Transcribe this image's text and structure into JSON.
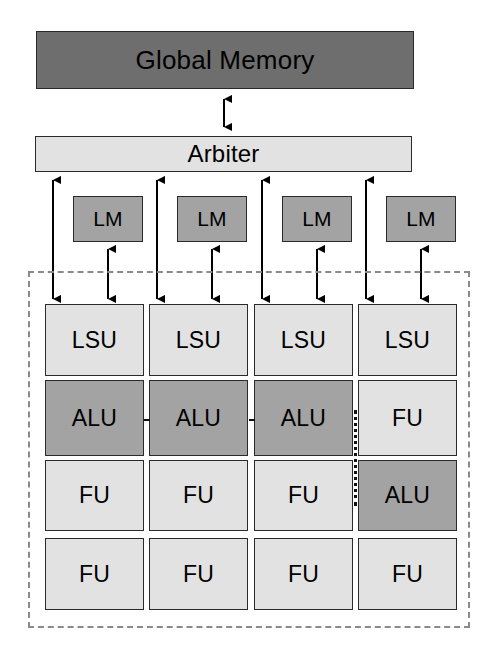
{
  "diagram": {
    "colors": {
      "dark_gray": "#6e6e6e",
      "mid_gray": "#a3a3a3",
      "light_gray": "#e2e2e2",
      "outline": "#2a2a2a",
      "dashed_border": "#8a8a8a",
      "arrow": "#000000",
      "background": "#ffffff"
    },
    "global_memory": {
      "label": "Global Memory",
      "shade": "dark"
    },
    "arbiter": {
      "label": "Arbiter",
      "shade": "light"
    },
    "local_memories": [
      {
        "label": "LM",
        "shade": "mid"
      },
      {
        "label": "LM",
        "shade": "mid"
      },
      {
        "label": "LM",
        "shade": "mid"
      },
      {
        "label": "LM",
        "shade": "mid"
      }
    ],
    "cluster": {
      "columns": 4,
      "rows": 4,
      "grid": [
        [
          {
            "label": "LSU",
            "shade": "light"
          },
          {
            "label": "LSU",
            "shade": "light"
          },
          {
            "label": "LSU",
            "shade": "light"
          },
          {
            "label": "LSU",
            "shade": "light"
          }
        ],
        [
          {
            "label": "ALU",
            "shade": "mid"
          },
          {
            "label": "ALU",
            "shade": "mid"
          },
          {
            "label": "ALU",
            "shade": "mid"
          },
          {
            "label": "FU",
            "shade": "light"
          }
        ],
        [
          {
            "label": "FU",
            "shade": "light"
          },
          {
            "label": "FU",
            "shade": "light"
          },
          {
            "label": "FU",
            "shade": "light"
          },
          {
            "label": "ALU",
            "shade": "mid"
          }
        ],
        [
          {
            "label": "FU",
            "shade": "light"
          },
          {
            "label": "FU",
            "shade": "light"
          },
          {
            "label": "FU",
            "shade": "light"
          },
          {
            "label": "FU",
            "shade": "light"
          }
        ]
      ]
    },
    "connectors": {
      "global_memory_to_arbiter": "double-headed-vertical-arrow",
      "arbiter_to_lsu": "double-headed-vertical-arrow",
      "lm_to_lsu": "double-headed-vertical-arrow",
      "arbiter_to_lm": "double-headed-vertical-arrow",
      "alu_chain": "dotted-horizontal-link",
      "column_split": "dotted-vertical-line"
    }
  }
}
